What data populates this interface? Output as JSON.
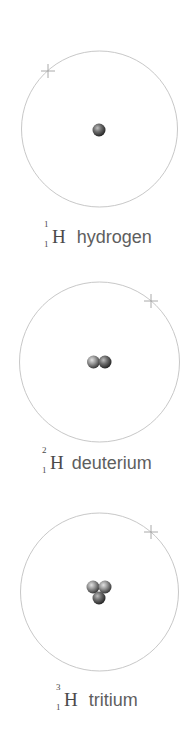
{
  "colors": {
    "orbit": "#c4c4c4",
    "electron": "#9a9a9a",
    "nucleus_light": "#d9d9d9",
    "nucleus_mid": "#8f8f8f",
    "nucleus_dark": "#3f3f3f",
    "text": "#5e5e5e"
  },
  "isotopes": [
    {
      "id": "hydrogen",
      "name": "hydrogen",
      "symbol": "H",
      "mass_number": "1",
      "atomic_number": "1",
      "nucleons": 1
    },
    {
      "id": "deuterium",
      "name": "deuterium",
      "symbol": "H",
      "mass_number": "2",
      "atomic_number": "1",
      "nucleons": 2
    },
    {
      "id": "tritium",
      "name": "tritium",
      "symbol": "H",
      "mass_number": "3",
      "atomic_number": "1",
      "nucleons": 3
    }
  ]
}
